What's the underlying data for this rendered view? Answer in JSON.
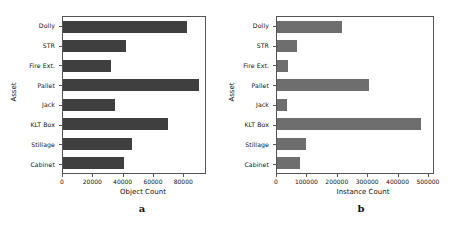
{
  "figure": {
    "panels": [
      {
        "caption": "a",
        "xlabel": "Object Count",
        "ylabel": "Asset"
      },
      {
        "caption": "b",
        "xlabel": "Instance Count",
        "ylabel": "Asset"
      }
    ]
  },
  "chart_data": [
    {
      "type": "bar",
      "orientation": "horizontal",
      "title": "",
      "panel_label": "a",
      "xlabel": "Object Count",
      "ylabel": "Asset",
      "categories": [
        "Dolly",
        "STR",
        "Fire Ext.",
        "Pallet",
        "Jack",
        "KLT Box",
        "Stillage",
        "Cabinet"
      ],
      "values": [
        83000,
        42000,
        32000,
        91000,
        35000,
        70000,
        46000,
        41000
      ],
      "xlim": [
        0,
        95000
      ],
      "xticks": [
        0,
        20000,
        40000,
        60000,
        80000
      ],
      "xticklabels": [
        "0",
        "20000",
        "40000",
        "60000",
        "80000"
      ],
      "grid": false,
      "legend": "none",
      "bar_color": "#3f3f3f"
    },
    {
      "type": "bar",
      "orientation": "horizontal",
      "title": "",
      "panel_label": "b",
      "xlabel": "Instance Count",
      "ylabel": "Asset",
      "categories": [
        "Dolly",
        "STR",
        "Fire Ext.",
        "Pallet",
        "Jack",
        "KLT Box",
        "Stillage",
        "Cabinet"
      ],
      "values": [
        216000,
        65000,
        35000,
        306000,
        32000,
        481000,
        96000,
        77000
      ],
      "xlim": [
        0,
        520000
      ],
      "xticks": [
        0,
        100000,
        200000,
        300000,
        400000,
        500000
      ],
      "xticklabels": [
        "0",
        "100000",
        "200000",
        "300000",
        "400000",
        "500000"
      ],
      "grid": false,
      "legend": "none",
      "bar_color": "#6e6e6e"
    }
  ]
}
